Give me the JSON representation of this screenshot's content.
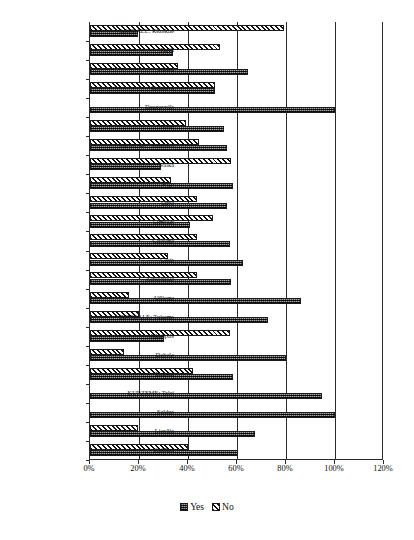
{
  "chart_data": {
    "type": "bar",
    "orientation": "horizontal",
    "title": "",
    "xlabel": "",
    "ylabel": "",
    "xlim": [
      0,
      120
    ],
    "xticks": [
      "0%",
      "20%",
      "40%",
      "60%",
      "80%",
      "100%",
      "120%"
    ],
    "xtick_values": [
      0,
      20,
      40,
      60,
      80,
      100,
      120
    ],
    "grid": true,
    "legend_position": "bottom-center",
    "legend": [
      "Yes",
      "No"
    ],
    "categories": [
      "LATGALE: Rēzekne",
      "Preiļi",
      "Ludza",
      "Krāslava",
      "Daugavpils",
      "Balvi",
      "VIDZEME: Valmiera",
      "Valka",
      "Rīga",
      "Ogre",
      "Limbaži",
      "Gulbene",
      "Cēsis",
      "Aizkraukle",
      "Alūksne",
      "ZEMGALE: Tukums",
      "Jēkabpils",
      "Dobele",
      "Bauska",
      "KURZEME: Talsi",
      "Saldus",
      "Liepāja",
      "Kuldīga"
    ],
    "series": [
      {
        "name": "Yes",
        "values": [
          19.5,
          34,
          64.5,
          51,
          100,
          54.5,
          56,
          29,
          58.5,
          56,
          41,
          57,
          62.5,
          57.5,
          86,
          72.5,
          30,
          80,
          58.5,
          94.5,
          100,
          67.5,
          60.5
        ]
      },
      {
        "name": "No",
        "values": [
          79,
          53,
          36,
          51,
          0,
          39,
          44.5,
          57.5,
          33,
          43.5,
          50,
          43.5,
          32,
          43.5,
          16,
          20,
          57,
          13.7,
          42,
          0,
          0,
          19.5,
          40
        ]
      }
    ],
    "colors": {
      "yes": "#4a4a4a",
      "no": "#ffffff",
      "axis": "#2b2b2b",
      "text": "#111111"
    }
  }
}
